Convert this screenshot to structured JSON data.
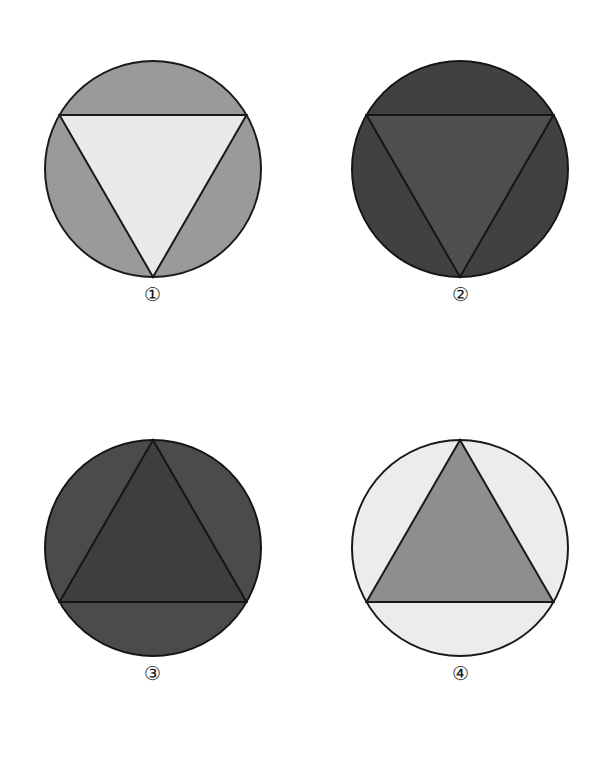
{
  "page": {
    "background_color": "#ffffff",
    "width": 611,
    "height": 769
  },
  "figures": [
    {
      "id": "figure-1",
      "label": "①",
      "label_text": "1",
      "circle_color": "#9a9a9a",
      "triangle_color": "#e9e9e9",
      "stroke_color": "#1a1a1a",
      "triangle_orientation": "down",
      "circle_center": [
        110,
        110
      ],
      "circle_radius": 108,
      "stroke_width": 2
    },
    {
      "id": "figure-2",
      "label": "②",
      "label_text": "2",
      "circle_color": "#414141",
      "triangle_color": "#4e4e4e",
      "stroke_color": "#151515",
      "triangle_orientation": "down",
      "circle_center": [
        110,
        110
      ],
      "circle_radius": 108,
      "stroke_width": 2
    },
    {
      "id": "figure-3",
      "label": "③",
      "label_text": "3",
      "circle_color": "#4b4b4b",
      "triangle_color": "#3e3e3e",
      "stroke_color": "#151515",
      "triangle_orientation": "up",
      "circle_center": [
        110,
        110
      ],
      "circle_radius": 108,
      "stroke_width": 2
    },
    {
      "id": "figure-4",
      "label": "④",
      "label_text": "4",
      "circle_color": "#ececec",
      "triangle_color": "#8e8e8e",
      "stroke_color": "#1a1a1a",
      "triangle_orientation": "up",
      "circle_center": [
        110,
        110
      ],
      "circle_radius": 108,
      "stroke_width": 2
    }
  ]
}
